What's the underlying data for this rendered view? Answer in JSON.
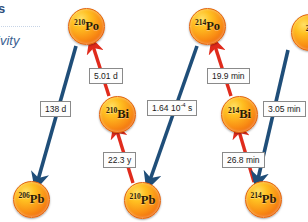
{
  "slide": {
    "heading_fragment": "s",
    "subheading_fragment": "ivity",
    "colors": {
      "heading_blue": "#2e4f7c",
      "alpha_arrow": "#1f4e79",
      "beta_arrow": "#e02b1c",
      "nuclide_fill": "#f98e14",
      "box_border": "#8a8a8a"
    }
  },
  "diagram": {
    "type": "decay-chain",
    "nuclides": [
      {
        "id": "po210",
        "mass": "210",
        "symbol": "Po",
        "x": 68,
        "y": 8,
        "clipped": false
      },
      {
        "id": "bi210",
        "mass": "210",
        "symbol": "Bi",
        "x": 99,
        "y": 96,
        "clipped": false
      },
      {
        "id": "pb210",
        "mass": "210",
        "symbol": "Pb",
        "x": 124,
        "y": 182,
        "clipped": false
      },
      {
        "id": "pb206",
        "mass": "206",
        "symbol": "Pb",
        "x": 13,
        "y": 181,
        "clipped": false
      },
      {
        "id": "po214",
        "mass": "214",
        "symbol": "Po",
        "x": 189,
        "y": 8,
        "clipped": false
      },
      {
        "id": "bi214",
        "mass": "214",
        "symbol": "Bi",
        "x": 221,
        "y": 96,
        "clipped": false
      },
      {
        "id": "pb214",
        "mass": "214",
        "symbol": "Pb",
        "x": 245,
        "y": 181,
        "clipped": false
      },
      {
        "id": "next",
        "mass": "21",
        "symbol": "",
        "x": 291,
        "y": 14,
        "clipped": true
      }
    ],
    "half_life_labels": [
      {
        "id": "hl-5d",
        "text": "5.01 d",
        "sup": "",
        "sup_tail": "",
        "x": 89,
        "y": 68,
        "decay": "alpha"
      },
      {
        "id": "hl-138d",
        "text": "138 d",
        "sup": "",
        "sup_tail": "",
        "x": 40,
        "y": 101,
        "decay": "alpha"
      },
      {
        "id": "hl-22y",
        "text": "22.3 y",
        "sup": "",
        "sup_tail": "",
        "x": 103,
        "y": 152,
        "decay": "beta"
      },
      {
        "id": "hl-164",
        "text": "1.64 10",
        "sup": "-4",
        "sup_tail": " s",
        "x": 147,
        "y": 100,
        "decay": "alpha"
      },
      {
        "id": "hl-199min",
        "text": "19.9 min",
        "sup": "",
        "sup_tail": "",
        "x": 207,
        "y": 68,
        "decay": "alpha"
      },
      {
        "id": "hl-268min",
        "text": "26.8 min",
        "sup": "",
        "sup_tail": "",
        "x": 222,
        "y": 152,
        "decay": "beta"
      },
      {
        "id": "hl-305min",
        "text": "3.05 min",
        "sup": "",
        "sup_tail": "",
        "x": 263,
        "y": 101,
        "decay": "alpha"
      }
    ],
    "arrows": [
      {
        "id": "a-pb210-to-bi210",
        "kind": "beta",
        "x1": 133,
        "y1": 183,
        "x2": 117,
        "y2": 131
      },
      {
        "id": "a-bi210-to-po210",
        "kind": "beta",
        "x1": 109,
        "y1": 96,
        "x2": 93,
        "y2": 46
      },
      {
        "id": "a-po210-to-pb206",
        "kind": "alpha",
        "x1": 76,
        "y1": 46,
        "x2": 38,
        "y2": 180
      },
      {
        "id": "a-pb214-to-bi214",
        "kind": "beta",
        "x1": 254,
        "y1": 182,
        "x2": 239,
        "y2": 131
      },
      {
        "id": "a-bi214-to-po214",
        "kind": "beta",
        "x1": 231,
        "y1": 96,
        "x2": 215,
        "y2": 46
      },
      {
        "id": "a-po214-to-pb210",
        "kind": "alpha",
        "x1": 197,
        "y1": 46,
        "x2": 150,
        "y2": 180
      },
      {
        "id": "a-next-to-pb214",
        "kind": "alpha",
        "x1": 288,
        "y1": 50,
        "x2": 258,
        "y2": 179
      }
    ]
  }
}
